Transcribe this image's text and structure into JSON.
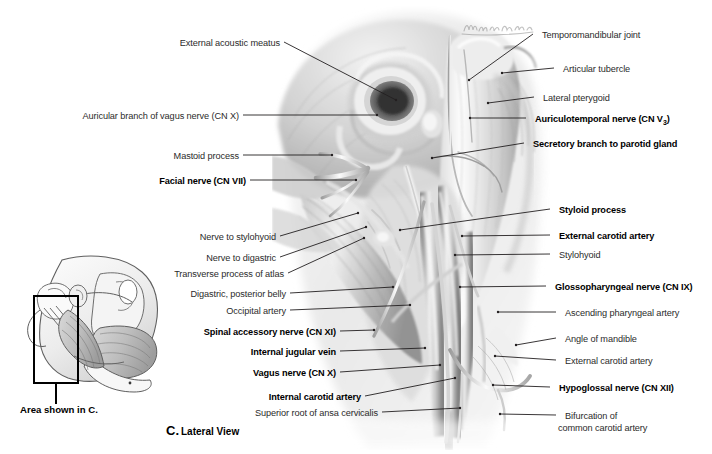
{
  "figure": {
    "caption_letter": "C.",
    "caption_text": "Lateral View",
    "inset_caption": "Area shown in C.",
    "view_type": "Lateral View",
    "ink": "#231f20"
  },
  "labels_left": [
    {
      "text": "External acoustic meatus",
      "bold": false,
      "x": 186,
      "y": 38,
      "lx": 284,
      "ly": 42,
      "tx": 396,
      "ty": 100
    },
    {
      "text": "Auricular branch of vagus nerve (CN X)",
      "bold": false,
      "x": 60,
      "y": 111,
      "lx": 243,
      "ly": 115,
      "tx": 377,
      "ty": 115
    },
    {
      "text": "Mastoid process",
      "bold": false,
      "x": 186,
      "y": 151,
      "lx": 243,
      "ly": 155,
      "tx": 332,
      "ty": 155
    },
    {
      "text": "Facial nerve (CN VII)",
      "bold": true,
      "x": 155,
      "y": 176,
      "lx": 250,
      "ly": 180,
      "tx": 356,
      "ty": 180
    },
    {
      "text": "Nerve to stylohyoid",
      "bold": false,
      "x": 195,
      "y": 232,
      "lx": 280,
      "ly": 236,
      "tx": 358,
      "ty": 213
    },
    {
      "text": "Nerve to digastric",
      "bold": false,
      "x": 206,
      "y": 253,
      "lx": 280,
      "ly": 257,
      "tx": 366,
      "ty": 227
    },
    {
      "text": "Transverse process of atlas",
      "bold": false,
      "x": 175,
      "y": 269,
      "lx": 288,
      "ly": 273,
      "tx": 364,
      "ty": 238
    },
    {
      "text": "Digastric, posterior belly",
      "bold": false,
      "x": 182,
      "y": 289,
      "lx": 290,
      "ly": 293,
      "tx": 393,
      "ty": 287
    },
    {
      "text": "Occipital artery",
      "bold": false,
      "x": 225,
      "y": 306,
      "lx": 290,
      "ly": 310,
      "tx": 410,
      "ty": 305
    },
    {
      "text": "Spinal accessory nerve (CN XI)",
      "bold": true,
      "x": 193,
      "y": 327,
      "lx": 340,
      "ly": 331,
      "tx": 374,
      "ty": 330
    },
    {
      "text": "Internal jugular vein",
      "bold": true,
      "x": 246,
      "y": 347,
      "lx": 340,
      "ly": 351,
      "tx": 425,
      "ty": 348
    },
    {
      "text": "Vagus nerve (CN X)",
      "bold": true,
      "x": 254,
      "y": 368,
      "lx": 340,
      "ly": 372,
      "tx": 440,
      "ty": 365
    },
    {
      "text": "Internal carotid artery",
      "bold": true,
      "x": 264,
      "y": 392,
      "lx": 365,
      "ly": 396,
      "tx": 455,
      "ty": 378
    },
    {
      "text": "Superior root of ansa cervicalis",
      "bold": false,
      "x": 260,
      "y": 408,
      "lx": 382,
      "ly": 412,
      "tx": 460,
      "ty": 408
    }
  ],
  "labels_right": [
    {
      "text": "Temporomandibular joint",
      "bold": false,
      "x": 535,
      "y": 30,
      "lx": 533,
      "ly": 34,
      "tx": 469,
      "ty": 80
    },
    {
      "text": "Articular tubercle",
      "bold": false,
      "x": 556,
      "y": 64,
      "lx": 554,
      "ly": 68,
      "tx": 502,
      "ty": 73
    },
    {
      "text": "Lateral pterygoid",
      "bold": false,
      "x": 536,
      "y": 93,
      "lx": 534,
      "ly": 97,
      "tx": 488,
      "ty": 103
    },
    {
      "text": "Auriculotemporal nerve (CN V",
      "bold": true,
      "sub": "3",
      "tail": ")",
      "x": 528,
      "y": 114,
      "lx": 526,
      "ly": 118,
      "tx": 470,
      "ty": 118
    },
    {
      "text": "Secretory branch to parotid gland",
      "bold": true,
      "x": 526,
      "y": 139,
      "lx": 524,
      "ly": 143,
      "tx": 432,
      "ty": 158
    },
    {
      "text": "Styloid process",
      "bold": true,
      "x": 552,
      "y": 205,
      "lx": 550,
      "ly": 209,
      "tx": 400,
      "ty": 230
    },
    {
      "text": "External carotid artery",
      "bold": true,
      "x": 552,
      "y": 231,
      "lx": 550,
      "ly": 235,
      "tx": 462,
      "ty": 236
    },
    {
      "text": "Stylohyoid",
      "bold": false,
      "x": 552,
      "y": 250,
      "lx": 550,
      "ly": 254,
      "tx": 455,
      "ty": 255
    },
    {
      "text": "Glossopharyngeal nerve (CN IX)",
      "bold": true,
      "x": 548,
      "y": 282,
      "lx": 546,
      "ly": 286,
      "tx": 460,
      "ty": 287
    },
    {
      "text": "Ascending pharyngeal artery",
      "bold": false,
      "x": 558,
      "y": 308,
      "lx": 556,
      "ly": 312,
      "tx": 498,
      "ty": 312
    },
    {
      "text": "Angle of mandible",
      "bold": false,
      "x": 558,
      "y": 334,
      "lx": 556,
      "ly": 338,
      "tx": 516,
      "ty": 345
    },
    {
      "text": "External carotid artery",
      "bold": false,
      "x": 558,
      "y": 356,
      "lx": 556,
      "ly": 360,
      "tx": 495,
      "ty": 356
    },
    {
      "text": "Hypoglossal nerve (CN XII)",
      "bold": true,
      "x": 552,
      "y": 383,
      "lx": 550,
      "ly": 387,
      "tx": 493,
      "ty": 385
    },
    {
      "text": "Bifurcation of",
      "bold": false,
      "x": 558,
      "y": 411,
      "lx": 556,
      "ly": 415,
      "tx": 500,
      "ty": 414
    },
    {
      "text": "common carotid artery",
      "bold": false,
      "x": 558,
      "y": 423,
      "lx": null,
      "ly": null,
      "tx": null,
      "ty": null
    }
  ]
}
